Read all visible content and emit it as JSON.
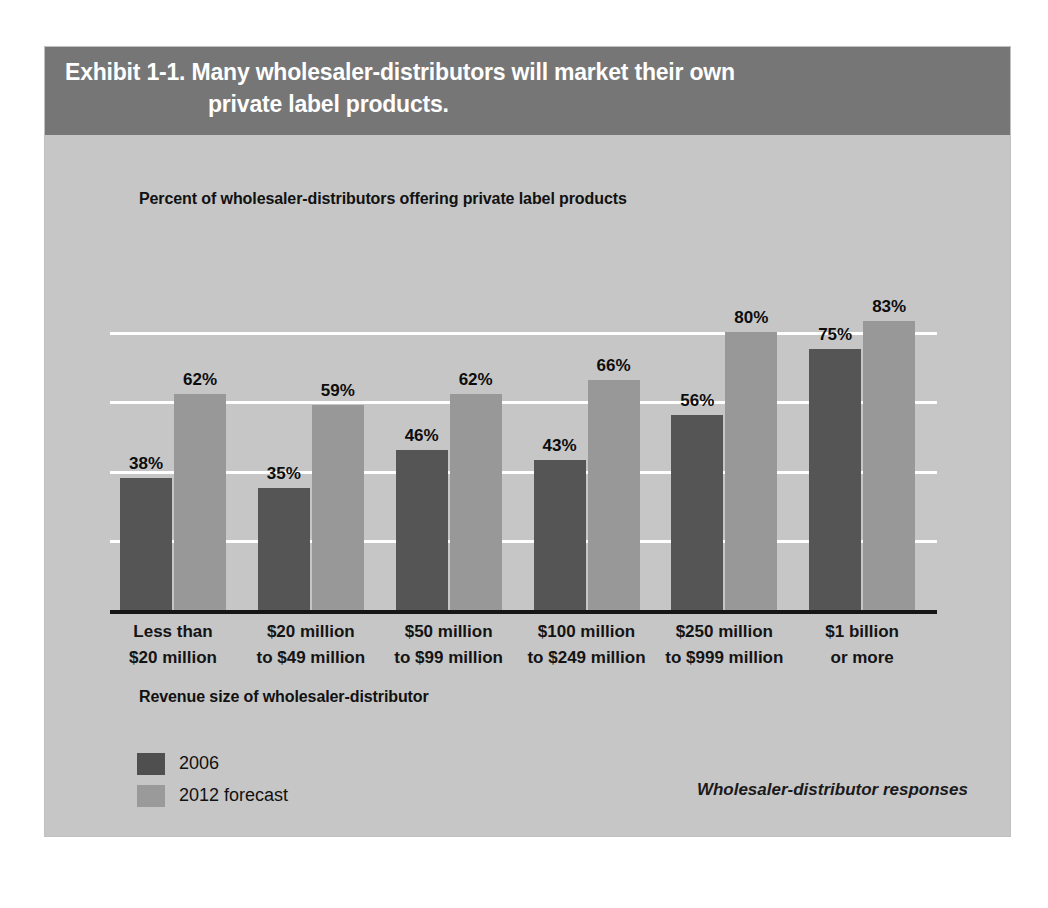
{
  "exhibit": {
    "title_line_1": "Exhibit 1-1. Many wholesaler-distributors will market their own",
    "title_line_2": "private label products.",
    "subtitle": "Percent of wholesaler-distributors offering private label products",
    "axis_title": "Revenue size of wholesaler-distributor",
    "source_note": "Wholesaler-distributor responses"
  },
  "legend": {
    "items": [
      {
        "label": "2006",
        "color": "#4f4f4f"
      },
      {
        "label": "2012 forecast",
        "color": "#9a9a9a"
      }
    ]
  },
  "colors": {
    "panel_background": "#c6c6c6",
    "title_band": "#767676",
    "series_2006": "#555555",
    "series_2012": "#989898",
    "gridline": "#ffffff",
    "axis_line": "#161616"
  },
  "chart_data": {
    "type": "bar",
    "title": "Exhibit 1-1. Many wholesaler-distributors will market their own private label products.",
    "subtitle": "Percent of wholesaler-distributors offering private label products",
    "xlabel": "Revenue size of wholesaler-distributor",
    "ylabel": "",
    "ylim": [
      0,
      100
    ],
    "grid": true,
    "gridlines": [
      20,
      40,
      60,
      80
    ],
    "legend_position": "bottom-left",
    "annotation": "Wholesaler-distributor responses",
    "categories": [
      "Less than\n$20 million",
      "$20 million\nto $49 million",
      "$50 million\nto $99 million",
      "$100 million\nto $249 million",
      "$250 million\nto $999 million",
      "$1 billion\nor more"
    ],
    "category_lines": [
      [
        "Less than",
        "$20 million"
      ],
      [
        "$20 million",
        "to $49 million"
      ],
      [
        "$50 million",
        "to $99 million"
      ],
      [
        "$100 million",
        "to $249 million"
      ],
      [
        "$250 million",
        "to $999 million"
      ],
      [
        "$1 billion",
        "or more"
      ]
    ],
    "series": [
      {
        "name": "2006",
        "values": [
          38,
          35,
          46,
          43,
          56,
          75
        ],
        "labels": [
          "38%",
          "35%",
          "46%",
          "43%",
          "56%",
          "75%"
        ]
      },
      {
        "name": "2012 forecast",
        "values": [
          62,
          59,
          62,
          66,
          80,
          83
        ],
        "labels": [
          "62%",
          "59%",
          "62%",
          "66%",
          "80%",
          "83%"
        ]
      }
    ]
  }
}
